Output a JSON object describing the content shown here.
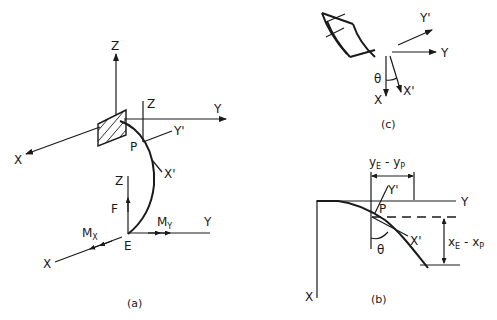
{
  "figure": {
    "panel_a": {
      "caption": "(a)",
      "labels": {
        "z_top": "Z",
        "z_p": "Z",
        "y_top": "Y",
        "x_top": "X",
        "y_prime": "Y'",
        "x_prime": "X'",
        "p": "P",
        "z_e": "Z",
        "f": "F",
        "mx_main": "M",
        "mx_sub": "X",
        "my_main": "M",
        "my_sub": "Y",
        "y_e": "Y",
        "e": "E",
        "x_e": "X"
      }
    },
    "panel_b": {
      "caption": "(b)",
      "labels": {
        "y_axis": "Y",
        "x_axis": "X",
        "p": "P",
        "y_prime": "Y'",
        "x_prime": "X'",
        "theta": "θ",
        "dim_y_main": "y",
        "dim_y_sub1": "E",
        "dim_y_minus": " - y",
        "dim_y_sub2": "P",
        "dim_x_main": "x",
        "dim_x_sub1": "E",
        "dim_x_minus": " - x",
        "dim_x_sub2": "P"
      }
    },
    "panel_c": {
      "caption": "(c)",
      "labels": {
        "y_prime": "Y'",
        "y": "Y",
        "theta": "θ",
        "x": "X",
        "x_prime": "X'"
      }
    },
    "colors": {
      "ink": "#1a1a1a",
      "background": "#ffffff"
    }
  }
}
